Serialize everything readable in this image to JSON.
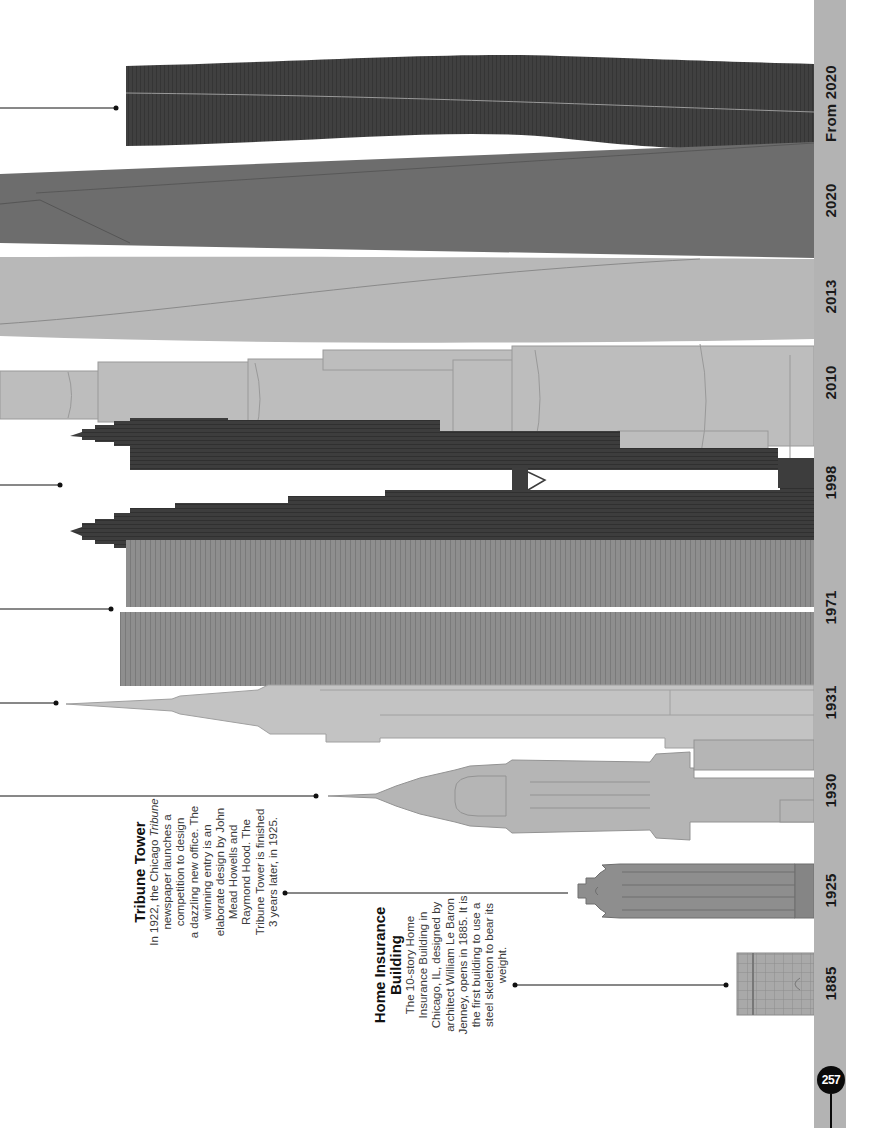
{
  "page": {
    "page_number": "257",
    "orientation": "rotated-90-ccw",
    "colors": {
      "timeline_bar": "#b3b3b3",
      "dark_building": "#3f3f3f",
      "mid_building": "#6e6e6e",
      "light_building": "#bdbdbd",
      "medium_building": "#8f8f8f",
      "badge": "#0a0a0a"
    }
  },
  "timeline": {
    "years": [
      {
        "label": "From 2020",
        "center_y": 103
      },
      {
        "label": "2020",
        "center_y": 200
      },
      {
        "label": "2013",
        "center_y": 296
      },
      {
        "label": "2010",
        "center_y": 382
      },
      {
        "label": "1998",
        "center_y": 482
      },
      {
        "label": "1971",
        "center_y": 607
      },
      {
        "label": "1931",
        "center_y": 702
      },
      {
        "label": "1930",
        "center_y": 790
      },
      {
        "label": "1925",
        "center_y": 890
      },
      {
        "label": "1885",
        "center_y": 983
      }
    ]
  },
  "callouts": [
    {
      "id": "tribune-tower",
      "title": "Tribune Tower",
      "body_prefix": "In 1922, the Chicago ",
      "body_italic": "Tribune",
      "body_suffix": "\nnewspaper launches a\ncompetition to design\na dazzling new office. The\nwinning entry is an\nelaborate design by John\nMead Howells and\nRaymond Hood. The\nTribune Tower is finished\n3 years later, in 1925."
    },
    {
      "id": "home-insurance-building",
      "title": "Home Insurance\nBuilding",
      "body": "The 10-story Home\nInsurance Building in\nChicago, IL, designed by\narchitect William Le Baron\nJenney, opens in 1885. It is\nthe first building to use a\nsteel skeleton to bear its\nweight."
    }
  ],
  "buildings": [
    {
      "year": "From 2020",
      "color": "dark"
    },
    {
      "year": "2020",
      "color": "mid"
    },
    {
      "year": "2013",
      "color": "light"
    },
    {
      "year": "2010",
      "color": "light"
    },
    {
      "year": "1998",
      "color": "dark",
      "note": "twin towers with skybridge"
    },
    {
      "year": "1971",
      "color": "medium",
      "note": "twin towers"
    },
    {
      "year": "1931",
      "color": "light"
    },
    {
      "year": "1930",
      "color": "light"
    },
    {
      "year": "1925",
      "color": "medium"
    },
    {
      "year": "1885",
      "color": "light-medium"
    }
  ]
}
